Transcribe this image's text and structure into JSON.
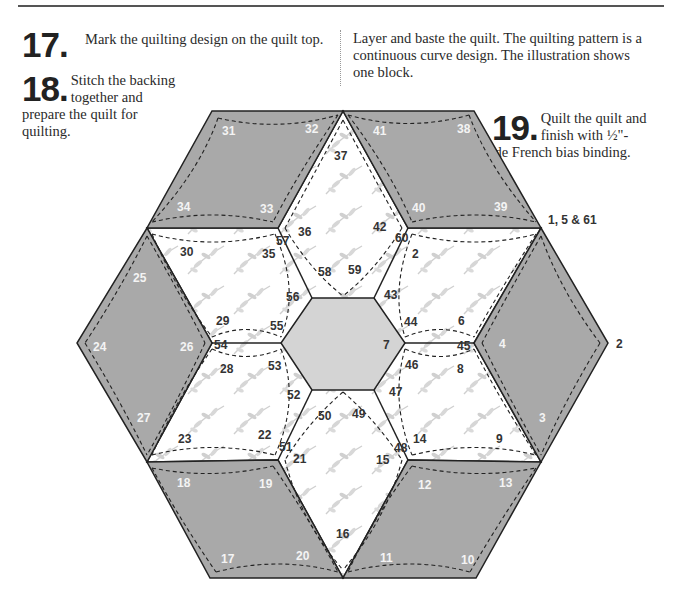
{
  "steps": {
    "s17": {
      "number": "17.",
      "text": "Mark the quilting design on the quilt top."
    },
    "s18": {
      "number": "18.",
      "text": "Stitch the backing together and prepare the quilt for quilting."
    },
    "s19": {
      "number": "19.",
      "text": "Quilt the quilt and finish with ½\"-wide French bias binding."
    }
  },
  "body_text": "Layer and baste the quilt. The quilting pattern is a continuous curve design. The illustration shows one block.",
  "colors": {
    "gray_diamond": "#a9a9a9",
    "center_hex": "#d4d4d4",
    "print_fabric": "#ffffff",
    "outline": "#222222"
  },
  "diagram": {
    "outer_labels": {
      "top_right": "1, 5 & 61",
      "right": "2"
    },
    "gray_labels": {
      "d31": "31",
      "d32": "32",
      "d33": "33",
      "d34": "34",
      "d41": "41",
      "d38": "38",
      "d40": "40",
      "d39": "39",
      "d25": "25",
      "d24": "24",
      "d26": "26",
      "d27": "27",
      "d4": "4",
      "d3": "3",
      "d18": "18",
      "d19": "19",
      "d17": "17",
      "d20": "20",
      "d12": "12",
      "d13": "13",
      "d11": "11",
      "d10": "10"
    },
    "print_labels": {
      "l37": "37",
      "l36": "36",
      "l57": "57",
      "l42": "42",
      "l60": "60",
      "l2b": "2",
      "l30": "30",
      "l35": "35",
      "l58": "58",
      "l59": "59",
      "l56": "56",
      "l43": "43",
      "l29": "29",
      "l55": "55",
      "l44": "44",
      "l6": "6",
      "l54": "54",
      "l7": "7",
      "l45": "45",
      "l28": "28",
      "l53": "53",
      "l46": "46",
      "l8": "8",
      "l52": "52",
      "l47": "47",
      "l50": "50",
      "l49": "49",
      "l23": "23",
      "l22": "22",
      "l51": "51",
      "l21": "21",
      "l48": "48",
      "l14": "14",
      "l9": "9",
      "l15": "15",
      "l16": "16"
    }
  }
}
